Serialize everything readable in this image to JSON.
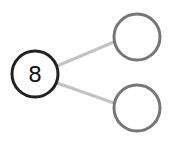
{
  "diagram": {
    "type": "number-bond",
    "whole": {
      "value": "8",
      "stroke": "#222222"
    },
    "parts": [
      {
        "value": "",
        "stroke": "#777777"
      },
      {
        "value": "",
        "stroke": "#777777"
      }
    ],
    "connector_color": "#c4c4c4"
  }
}
